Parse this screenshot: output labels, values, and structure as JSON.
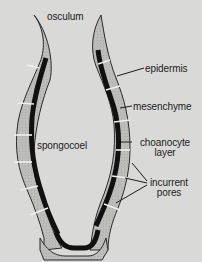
{
  "diagram": {
    "labels": {
      "osculum": "osculum",
      "epidermis": "epidermis",
      "mesenchyme": "mesenchyme",
      "choanocyte_line1": "choanocyte",
      "choanocyte_line2": "layer",
      "spongocoel": "spongocoel",
      "incurrent_line1": "incurrent",
      "incurrent_line2": "pores"
    },
    "colors": {
      "background": "#d9d9d7",
      "wall_fill": "#b9b9b6",
      "choanocyte": "#111111",
      "outline": "#2a2a2a",
      "leader": "#1c1c1c"
    }
  }
}
